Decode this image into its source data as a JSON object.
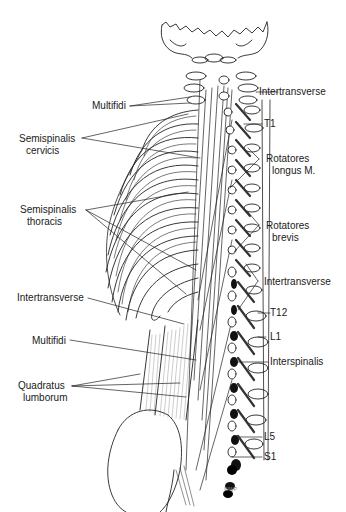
{
  "figure": {
    "signature": "WWP"
  },
  "labels_left": [
    {
      "id": "multifidi-cervical",
      "lines": [
        "Multifidi"
      ]
    },
    {
      "id": "semispinalis-cervicis",
      "lines": [
        "Semispinalis",
        "cervicis"
      ]
    },
    {
      "id": "semispinalis-thoracis",
      "lines": [
        "Semispinalis",
        "thoracis"
      ]
    },
    {
      "id": "intertransverse-lumbar-left",
      "lines": [
        "Intertransverse"
      ]
    },
    {
      "id": "multifidi-lumbar",
      "lines": [
        "Multifidi"
      ]
    },
    {
      "id": "quadratus-lumborum",
      "lines": [
        "Quadratus",
        "lumborum"
      ]
    }
  ],
  "labels_right": [
    {
      "id": "intertransverse-cervical",
      "lines": [
        "Intertransverse"
      ]
    },
    {
      "id": "t1",
      "lines": [
        "T1"
      ]
    },
    {
      "id": "rotatores-longus",
      "lines": [
        "Rotatores",
        "longus M."
      ]
    },
    {
      "id": "rotatores-brevis",
      "lines": [
        "Rotatores",
        "brevis"
      ]
    },
    {
      "id": "intertransverse-thoracic",
      "lines": [
        "Intertransverse"
      ]
    },
    {
      "id": "t12",
      "lines": [
        "T12"
      ]
    },
    {
      "id": "l1",
      "lines": [
        "L1"
      ]
    },
    {
      "id": "interspinalis",
      "lines": [
        "Interspinalis"
      ]
    },
    {
      "id": "l5",
      "lines": [
        "L5"
      ]
    },
    {
      "id": "s1",
      "lines": [
        "S1"
      ]
    }
  ]
}
